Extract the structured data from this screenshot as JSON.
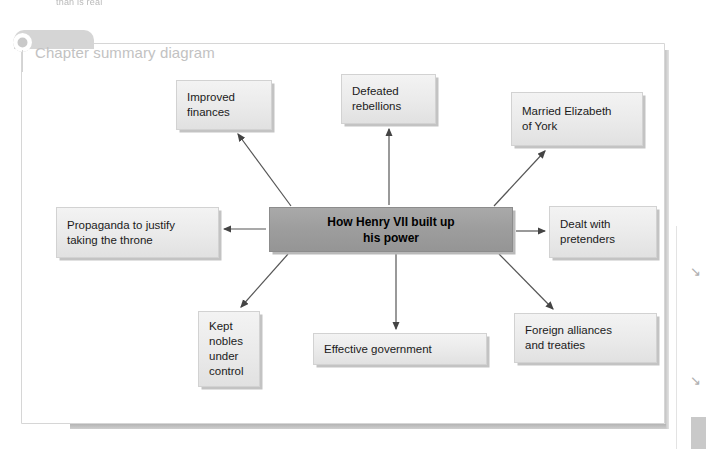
{
  "page": {
    "background_color": "#ffffff",
    "cropped_header_fragment": "than is real"
  },
  "card": {
    "title": "Chapter summary diagram",
    "title_color": "#c2c2c2",
    "border_color": "#d6d6d6"
  },
  "diagram": {
    "type": "spider-diagram",
    "center_node": {
      "id": "center",
      "label": "How Henry VII built up\nhis power",
      "fill_color": "#9d9d9d",
      "text_color": "#000000",
      "bold": true
    },
    "node_fill_color": "#eaeaea",
    "node_border_color": "#d2d2d2",
    "nodes": [
      {
        "id": "finances",
        "label": "Improved\nfinances",
        "direction": "up-left"
      },
      {
        "id": "rebellions",
        "label": "Defeated\nrebellions",
        "direction": "up"
      },
      {
        "id": "elizabeth",
        "label": "Married Elizabeth\nof York",
        "direction": "up-right"
      },
      {
        "id": "propaganda",
        "label": "Propaganda to justify\ntaking the throne",
        "direction": "left"
      },
      {
        "id": "pretenders",
        "label": "Dealt with\npretenders",
        "direction": "right"
      },
      {
        "id": "nobles",
        "label": "Kept\nnobles\nunder\ncontrol",
        "direction": "down-left"
      },
      {
        "id": "government",
        "label": "Effective government",
        "direction": "down"
      },
      {
        "id": "foreign",
        "label": "Foreign alliances\nand treaties",
        "direction": "down-right"
      }
    ],
    "arrows": [
      {
        "from": "center",
        "to": "finances"
      },
      {
        "from": "center",
        "to": "rebellions"
      },
      {
        "from": "center",
        "to": "elizabeth"
      },
      {
        "from": "center",
        "to": "propaganda"
      },
      {
        "from": "center",
        "to": "pretenders"
      },
      {
        "from": "center",
        "to": "nobles"
      },
      {
        "from": "center",
        "to": "government"
      },
      {
        "from": "center",
        "to": "foreign"
      }
    ],
    "arrow_color": "#555555"
  },
  "scan_artifacts": {
    "mark_1": "↘",
    "mark_2": "↘"
  }
}
